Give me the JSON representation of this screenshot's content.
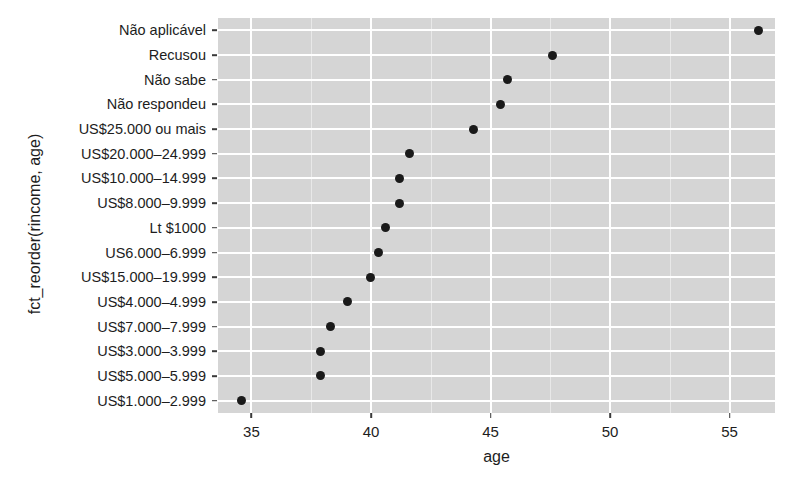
{
  "chart_data": {
    "type": "scatter",
    "title": "",
    "xlabel": "age",
    "ylabel": "fct_reorder(rincome, age)",
    "xlim": [
      33.6,
      56.9
    ],
    "xticks": [
      35,
      40,
      45,
      50,
      55
    ],
    "xtick_labels": [
      "35",
      "40",
      "45",
      "50",
      "55"
    ],
    "grid": true,
    "legend": "none",
    "panel_background": "#d5d5d5",
    "gridline_color": "#ffffff",
    "point_color": "#1a1a1a",
    "categories": [
      "Não aplicável",
      "Recusou",
      "Não sabe",
      "Não respondeu",
      "US$25.000 ou mais",
      "US$20.000–24.999",
      "US$10.000–14.999",
      "US$8.000–9.999",
      "Lt $1000",
      "US6.000–6.999",
      "US$15.000–19.999",
      "US$4.000–4.999",
      "US$7.000–7.999",
      "US$3.000–3.999",
      "US$5.000–5.999",
      "US$1.000–2.999"
    ],
    "values": [
      56.2,
      47.6,
      45.7,
      45.4,
      44.3,
      41.6,
      41.2,
      41.2,
      40.6,
      40.3,
      40.0,
      39.0,
      38.3,
      37.9,
      37.9,
      34.6
    ]
  },
  "axes": {
    "x_title": "age",
    "y_title": "fct_reorder(rincome, age)"
  }
}
